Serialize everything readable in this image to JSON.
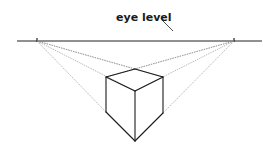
{
  "diagram": {
    "label": "eye level",
    "colors": {
      "background": "#ffffff",
      "horizon": "#222222",
      "cube_edges": "#1a1a1a",
      "construction_lines": "#8a8a8a",
      "label_text": "#1a1a1a"
    },
    "horizon": {
      "y": 41,
      "x1": 17,
      "x2": 262
    },
    "vanishing_points": {
      "left": {
        "x": 37,
        "y": 41
      },
      "right": {
        "x": 234,
        "y": 41
      }
    },
    "label_pointer": {
      "x1": 162,
      "y1": 20,
      "x2": 173,
      "y2": 31
    },
    "cube": {
      "back_top": {
        "x": 135,
        "y": 69
      },
      "top_left": {
        "x": 106,
        "y": 77
      },
      "top_right": {
        "x": 163,
        "y": 77
      },
      "front_top": {
        "x": 135,
        "y": 91
      },
      "bottom_left": {
        "x": 106,
        "y": 112
      },
      "bottom_right": {
        "x": 163,
        "y": 113
      },
      "front_bottom": {
        "x": 135,
        "y": 141
      }
    }
  }
}
